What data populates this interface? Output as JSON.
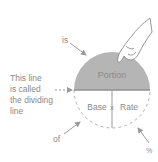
{
  "diagram": {
    "top_label": "Portion",
    "bottom_left_label": "Base",
    "bottom_right_label": "Rate",
    "multiply_symbol": "x",
    "annotation_is": "is",
    "annotation_of": "of",
    "annotation_percent": "%",
    "dividing_line_note": [
      "This line",
      "is called",
      "the dividing",
      "line"
    ],
    "colors": {
      "top_fill": "#b3b3b3",
      "outline": "#a8a8a8",
      "text": "#8a8a8a",
      "arrow": "#9a9a9a"
    }
  }
}
